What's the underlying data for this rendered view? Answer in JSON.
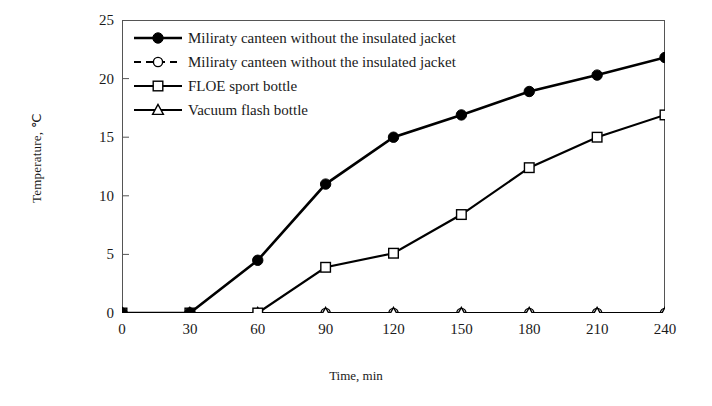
{
  "chart_data": {
    "type": "line",
    "title": "",
    "xlabel": "Time, min",
    "ylabel": "Temperature, ℃",
    "x": [
      0,
      30,
      60,
      90,
      120,
      150,
      180,
      210,
      240
    ],
    "xticklabels": [
      "0",
      "30",
      "60",
      "90",
      "120",
      "150",
      "180",
      "210",
      "240"
    ],
    "yticklabels": [
      "0",
      "5",
      "10",
      "15",
      "20",
      "25"
    ],
    "yticks": [
      0,
      5,
      10,
      15,
      20,
      25
    ],
    "xlim": [
      0,
      240
    ],
    "ylim": [
      0,
      25
    ],
    "grid": false,
    "legend_position": "upper left",
    "series": [
      {
        "name": "Miliraty canteen without the insulated jacket",
        "marker": "filled-circle",
        "linestyle": "solid",
        "values": [
          0,
          0,
          4.5,
          11.0,
          15.0,
          16.9,
          18.9,
          20.3,
          21.8
        ]
      },
      {
        "name": "Miliraty canteen without the insulated jacket",
        "marker": "open-circle",
        "linestyle": "dashed",
        "values": [
          0,
          0,
          0,
          0,
          0,
          0,
          0,
          0,
          0
        ]
      },
      {
        "name": "FLOE sport bottle",
        "marker": "open-square",
        "linestyle": "solid",
        "values": [
          0,
          0,
          0,
          3.9,
          5.1,
          8.4,
          12.4,
          15.0,
          16.9
        ]
      },
      {
        "name": "Vacuum flash bottle",
        "marker": "open-triangle",
        "linestyle": "solid",
        "values": [
          0,
          0,
          0,
          0,
          0,
          0,
          0,
          0,
          0
        ]
      }
    ],
    "colors": {
      "line": "#000000",
      "axis": "#555555",
      "text": "#1a1a1a",
      "background": "#ffffff"
    }
  }
}
